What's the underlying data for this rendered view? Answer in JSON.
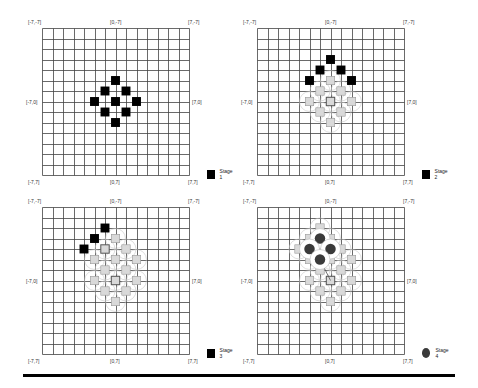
{
  "figure": {
    "grid": {
      "cells": 14,
      "range": [
        -7,
        7
      ],
      "line_color": "#444444"
    },
    "colors": {
      "active": "#000000",
      "previous": "#d9d9d9",
      "previous_border": "#9a9a9a",
      "circle": "#3a3a3a",
      "connector": "#9a9a9a"
    },
    "panels": [
      {
        "id": "stage-1",
        "labels": {
          "top_left": "[-7,-7]",
          "top_center": "[0,-7]",
          "top_right": "[7,-7]",
          "mid_left": "[-7,0]",
          "mid_right": "[7,0]",
          "bottom_left": "[-7,7]",
          "bottom_center": "[0,7]",
          "bottom_right": "[7,7]"
        },
        "legend": {
          "label": "Stage 1",
          "marker": "square"
        },
        "active_squares": [
          [
            0,
            -2
          ],
          [
            -1,
            -1
          ],
          [
            1,
            -1
          ],
          [
            -2,
            0
          ],
          [
            0,
            0
          ],
          [
            2,
            0
          ],
          [
            -1,
            1
          ],
          [
            1,
            1
          ],
          [
            0,
            2
          ]
        ],
        "previous_squares": [],
        "emphasized_previous": [],
        "circles": []
      },
      {
        "id": "stage-2",
        "labels": {
          "top_left": "[-7,-7]",
          "top_center": "[0,-7]",
          "top_right": "[7,-7]",
          "mid_left": "[-7,0]",
          "mid_right": "[7,0]",
          "bottom_left": "[-7,7]",
          "bottom_center": "[0,7]",
          "bottom_right": "[7,7]"
        },
        "legend": {
          "label": "Stage 2",
          "marker": "square"
        },
        "active_squares": [
          [
            0,
            -4
          ],
          [
            -1,
            -3
          ],
          [
            1,
            -3
          ],
          [
            -2,
            -2
          ],
          [
            2,
            -2
          ]
        ],
        "previous_squares": [
          [
            0,
            -2
          ],
          [
            -1,
            -1
          ],
          [
            1,
            -1
          ],
          [
            -2,
            0
          ],
          [
            0,
            0
          ],
          [
            2,
            0
          ],
          [
            -1,
            1
          ],
          [
            1,
            1
          ],
          [
            0,
            2
          ]
        ],
        "emphasized_previous": [
          [
            0,
            0
          ]
        ],
        "circles": []
      },
      {
        "id": "stage-3",
        "labels": {
          "top_left": "[-7,-7]",
          "top_center": "[0,-7]",
          "top_right": "[7,-7]",
          "mid_left": "[-7,0]",
          "mid_right": "[7,0]",
          "bottom_left": "[-7,7]",
          "bottom_center": "[0,7]",
          "bottom_right": "[7,7]"
        },
        "legend": {
          "label": "Stage 3",
          "marker": "square"
        },
        "active_squares": [
          [
            -1,
            -5
          ],
          [
            -2,
            -4
          ],
          [
            -3,
            -3
          ]
        ],
        "previous_squares": [
          [
            0,
            -4
          ],
          [
            -1,
            -3
          ],
          [
            1,
            -3
          ],
          [
            -2,
            -2
          ],
          [
            0,
            -2
          ],
          [
            2,
            -2
          ],
          [
            -1,
            -1
          ],
          [
            1,
            -1
          ],
          [
            -2,
            0
          ],
          [
            0,
            0
          ],
          [
            2,
            0
          ],
          [
            -1,
            1
          ],
          [
            1,
            1
          ],
          [
            0,
            2
          ]
        ],
        "emphasized_previous": [
          [
            0,
            0
          ],
          [
            -1,
            -3
          ]
        ],
        "circles": []
      },
      {
        "id": "stage-4",
        "labels": {
          "top_left": "[-7,-7]",
          "top_center": "[0,-7]",
          "top_right": "[7,-7]",
          "mid_left": "[-7,0]",
          "mid_right": "[7,0]",
          "bottom_left": "[-7,7]",
          "bottom_center": "[0,7]",
          "bottom_right": "[7,7]"
        },
        "legend": {
          "label": "Stage 4",
          "marker": "circle"
        },
        "active_squares": [],
        "previous_squares": [
          [
            -1,
            -5
          ],
          [
            -2,
            -4
          ],
          [
            0,
            -4
          ],
          [
            -3,
            -3
          ],
          [
            -1,
            -3
          ],
          [
            1,
            -3
          ],
          [
            -2,
            -2
          ],
          [
            0,
            -2
          ],
          [
            2,
            -2
          ],
          [
            -1,
            -1
          ],
          [
            1,
            -1
          ],
          [
            -2,
            0
          ],
          [
            0,
            0
          ],
          [
            2,
            0
          ],
          [
            -1,
            1
          ],
          [
            1,
            1
          ],
          [
            0,
            2
          ]
        ],
        "emphasized_previous": [
          [
            -1,
            -3
          ],
          [
            0,
            0
          ]
        ],
        "circles": [
          [
            -1,
            -4
          ],
          [
            -2,
            -3
          ],
          [
            0,
            -3
          ],
          [
            -1,
            -2
          ]
        ],
        "connectors": [
          [
            [
              -1,
              -4
            ],
            [
              -1,
              -2
            ]
          ],
          [
            [
              -1,
              -2
            ],
            [
              0,
              0
            ]
          ]
        ]
      }
    ]
  }
}
